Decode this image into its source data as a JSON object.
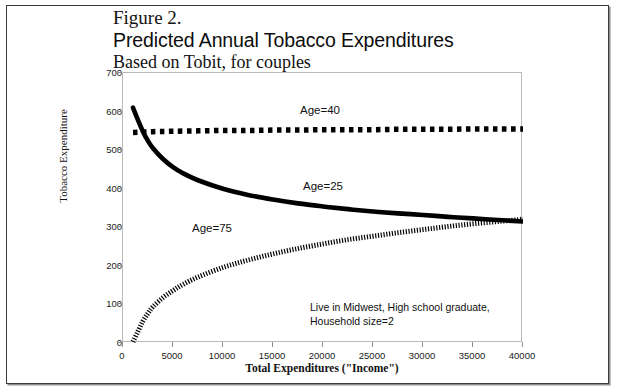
{
  "figure": {
    "title_line1": "Figure 2.",
    "title_line2": "Predicted Annual Tobacco Expenditures",
    "title_line3": "Based on Tobit, for couples"
  },
  "annotation": {
    "line1": "Live in Midwest, High school graduate,",
    "line2": "Household size=2"
  },
  "chart_data": {
    "type": "line",
    "title": "Predicted Annual Tobacco Expenditures",
    "subtitle": "Based on Tobit, for couples",
    "figure_number": "Figure 2.",
    "xlabel": "Total Expenditures (\"Income\")",
    "ylabel": "Tobacco Expenditure",
    "xlim": [
      0,
      40000
    ],
    "ylim": [
      0,
      700
    ],
    "xticks": [
      0,
      5000,
      10000,
      15000,
      20000,
      25000,
      30000,
      35000,
      40000
    ],
    "yticks": [
      0,
      100,
      200,
      300,
      400,
      500,
      600,
      700
    ],
    "xtick_labels": [
      "0",
      "5000",
      "10000",
      "15000",
      "20000",
      "25000",
      "30000",
      "35000",
      "40000"
    ],
    "ytick_labels": [
      "0",
      "100",
      "200",
      "300",
      "400",
      "500",
      "600",
      "700"
    ],
    "grid": false,
    "legend_position": "inline-annotations",
    "annotations": [
      "Live in Midwest, High school graduate,",
      "Household size=2"
    ],
    "series": [
      {
        "name": "Age=40",
        "label": "Age=40",
        "style": "dotted-thick",
        "color": "#000000",
        "x": [
          1000,
          2000,
          3000,
          5000,
          7500,
          10000,
          12500,
          15000,
          17500,
          20000,
          22500,
          25000,
          27500,
          30000,
          32500,
          35000,
          37500,
          40000
        ],
        "values": [
          546,
          547,
          548,
          549,
          550,
          551,
          551,
          552,
          552,
          553,
          553,
          553,
          554,
          554,
          554,
          555,
          555,
          555
        ]
      },
      {
        "name": "Age=25",
        "label": "Age=25",
        "style": "solid-thick",
        "color": "#000000",
        "x": [
          1000,
          1500,
          2000,
          2500,
          3000,
          4000,
          5000,
          6000,
          7500,
          10000,
          12500,
          15000,
          17500,
          20000,
          22500,
          25000,
          27500,
          30000,
          32500,
          35000,
          37500,
          40000
        ],
        "values": [
          610,
          578,
          548,
          524,
          505,
          477,
          456,
          440,
          422,
          400,
          384,
          372,
          362,
          354,
          347,
          341,
          336,
          332,
          327,
          323,
          319,
          315
        ]
      },
      {
        "name": "Age=75",
        "label": "Age=75",
        "style": "dash-dot",
        "color": "#000000",
        "x": [
          1000,
          1500,
          2000,
          2500,
          3000,
          4000,
          5000,
          6000,
          7500,
          10000,
          12500,
          15000,
          17500,
          20000,
          22500,
          25000,
          27500,
          30000,
          32500,
          35000,
          37500,
          40000
        ],
        "values": [
          3,
          30,
          57,
          77,
          94,
          118,
          136,
          152,
          171,
          196,
          215,
          231,
          245,
          257,
          268,
          277,
          286,
          294,
          302,
          309,
          315,
          321
        ]
      }
    ],
    "intersections": [
      {
        "series_a": "Age=25",
        "series_b": "Age=75",
        "x": 29000,
        "y": 335
      },
      {
        "series_a": "Age=25",
        "series_b": "Age=40",
        "x": 2000,
        "y": 548
      }
    ]
  }
}
